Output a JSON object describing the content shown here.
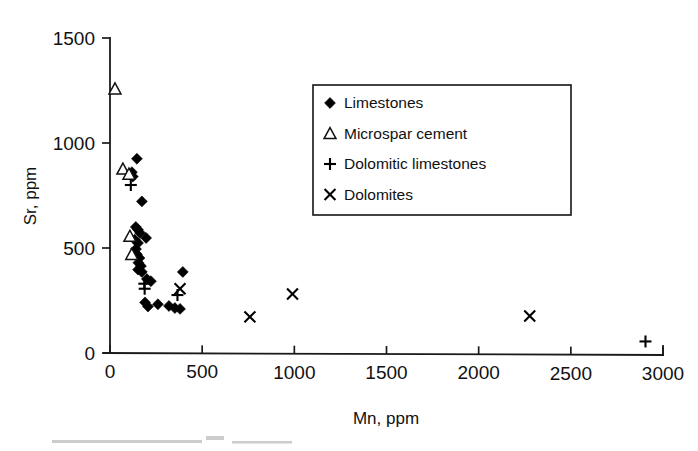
{
  "chart_data": {
    "type": "scatter",
    "title": "",
    "xlabel": "Mn, ppm",
    "ylabel": "Sr, ppm",
    "xlim": [
      0,
      3000
    ],
    "ylim": [
      0,
      1500
    ],
    "xticks": [
      0,
      500,
      1000,
      1500,
      2000,
      2500,
      3000
    ],
    "yticks": [
      0,
      500,
      1000,
      1500
    ],
    "xtick_labels": [
      "0",
      "500",
      "1000",
      "1500",
      "2000",
      "2500",
      "3000"
    ],
    "ytick_labels": [
      "0",
      "500",
      "1000",
      "1500"
    ],
    "grid": false,
    "legend_position": "upper-center-right",
    "series": [
      {
        "name": "Limestones",
        "marker": "filled-diamond",
        "color": "#000000",
        "points": [
          [
            146,
            925
          ],
          [
            119,
            861
          ],
          [
            124,
            840
          ],
          [
            173,
            722
          ],
          [
            140,
            600
          ],
          [
            151,
            588
          ],
          [
            163,
            572
          ],
          [
            196,
            548
          ],
          [
            134,
            540
          ],
          [
            152,
            524
          ],
          [
            141,
            495
          ],
          [
            146,
            470
          ],
          [
            160,
            452
          ],
          [
            154,
            430
          ],
          [
            168,
            414
          ],
          [
            152,
            397
          ],
          [
            173,
            386
          ],
          [
            395,
            386
          ],
          [
            200,
            352
          ],
          [
            222,
            342
          ],
          [
            190,
            241
          ],
          [
            260,
            232
          ],
          [
            320,
            224
          ],
          [
            352,
            214
          ],
          [
            380,
            210
          ],
          [
            206,
            221
          ]
        ]
      },
      {
        "name": "Microspar cement",
        "marker": "open-triangle",
        "color": "#111111",
        "points": [
          [
            27,
            1258
          ],
          [
            70,
            876
          ],
          [
            103,
            852
          ],
          [
            108,
            556
          ],
          [
            118,
            470
          ]
        ]
      },
      {
        "name": "Dolomitic limestones",
        "marker": "plus",
        "color": "#000000",
        "points": [
          [
            113,
            800
          ],
          [
            186,
            330
          ],
          [
            188,
            306
          ],
          [
            366,
            276
          ],
          [
            2905,
            55
          ]
        ]
      },
      {
        "name": "Dolomites",
        "marker": "cross",
        "color": "#000000",
        "points": [
          [
            380,
            306
          ],
          [
            759,
            172
          ],
          [
            990,
            281
          ],
          [
            2277,
            176
          ]
        ]
      }
    ]
  },
  "legend": {
    "items": [
      {
        "label": "Limestones",
        "marker": "filled-diamond"
      },
      {
        "label": "Microspar cement",
        "marker": "open-triangle"
      },
      {
        "label": "Dolomitic limestones",
        "marker": "plus"
      },
      {
        "label": "Dolomites",
        "marker": "cross"
      }
    ]
  },
  "axes": {
    "x_label": "Mn, ppm",
    "y_label": "Sr, ppm"
  },
  "colors": {
    "ink": "#000000",
    "axis": "#1a1a1a",
    "background": "#ffffff"
  }
}
